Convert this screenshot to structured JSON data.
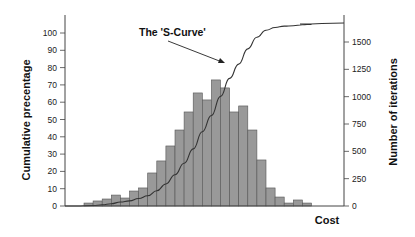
{
  "chart_data": {
    "type": "bar",
    "subtype": "histogram with cumulative line (S-curve)",
    "xlabel": "Cost",
    "ylabel_left": "Cumulative precentage",
    "ylabel_right": "Number of iterations",
    "annotation": "The 'S-Curve'",
    "left_axis": {
      "ticks": [
        0,
        10,
        20,
        30,
        40,
        50,
        60,
        70,
        80,
        90,
        100
      ],
      "ylim": [
        0,
        105
      ]
    },
    "right_axis": {
      "ticks": [
        0,
        250,
        500,
        750,
        1000,
        1250,
        1500
      ],
      "ylim": [
        0,
        1600
      ]
    },
    "grid": false,
    "bin_index": [
      1,
      2,
      3,
      4,
      5,
      6,
      7,
      8,
      9,
      10,
      11,
      12,
      13,
      14,
      15,
      16,
      17,
      18,
      19,
      20,
      21,
      22,
      23,
      24,
      25
    ],
    "series": [
      {
        "name": "Number of iterations",
        "axis": "right",
        "type": "bar",
        "values": [
          27,
          46,
          64,
          100,
          73,
          137,
          165,
          302,
          412,
          549,
          695,
          860,
          1034,
          970,
          1153,
          1080,
          860,
          915,
          695,
          421,
          165,
          82,
          27,
          55,
          27
        ]
      },
      {
        "name": "Cumulative percentage",
        "axis": "left",
        "type": "line",
        "description": "S-shaped cumulative curve rising from 0 to ~100%"
      }
    ],
    "colors": {
      "bar_fill": "#999999",
      "bar_stroke": "#555555",
      "line": "#333333",
      "axis": "#444444"
    }
  }
}
